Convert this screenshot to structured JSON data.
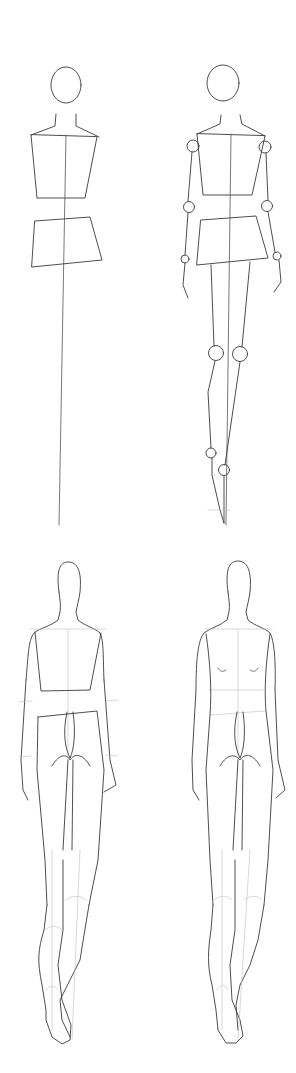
{
  "illustration": {
    "title": "",
    "description": "Four-step pencil sketch of a fashion figure drawn from the back",
    "background_color": "#ffffff",
    "line_color": "#3a3a3a",
    "guide_color": "#bdbdbd",
    "steps": [
      {
        "index": 1,
        "label": "",
        "content": "Head oval, neck, torso and hip boxes with a center balance line"
      },
      {
        "index": 2,
        "label": "",
        "content": "Added arms and legs as lines with joint circles at shoulders, elbows, wrists, knees, ankles"
      },
      {
        "index": 3,
        "label": "",
        "content": "Fleshed-out back view with torso boxes, buttocks, arms and legs"
      },
      {
        "index": 4,
        "label": "",
        "content": "Refined back view with contour lines, shoulder blades and leg shading guides"
      }
    ]
  }
}
